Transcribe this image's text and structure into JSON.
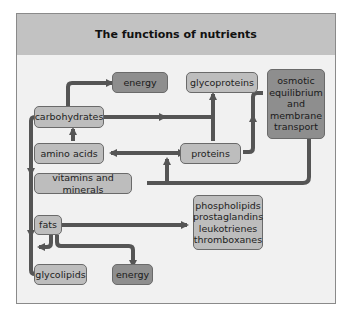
{
  "title": "The functions of nutrients",
  "colors": {
    "header_bg": "#c2c2c2",
    "panel_bg": "#f1f1f1",
    "light_box": "#bdbdbd",
    "dark_box": "#8e8e8e",
    "arrow": "#555555"
  },
  "nodes": {
    "energy_top": "energy",
    "glycoproteins": "glycoproteins",
    "osmotic": "osmotic equilibrium and membrane transport",
    "carbohydrates": "carbohydrates",
    "amino_acids": "amino acids",
    "proteins": "proteins",
    "vitamins": "vitamins and minerals",
    "fats": "fats",
    "lipids_products": "phospholipids prostaglandins leukotrienes thromboxanes",
    "glycolipids": "glycolipids",
    "energy_bottom": "energy"
  },
  "edges": [
    {
      "from": "carbohydrates",
      "to": "energy (top)"
    },
    {
      "from": "carbohydrates",
      "to": "glycoproteins"
    },
    {
      "from": "carbohydrates",
      "to": "glycolipids"
    },
    {
      "from": "amino acids",
      "to": "carbohydrates"
    },
    {
      "from": "amino acids",
      "to": "proteins",
      "bidirectional": true
    },
    {
      "from": "proteins",
      "to": "glycoproteins"
    },
    {
      "from": "proteins",
      "to": "osmotic equilibrium and membrane transport"
    },
    {
      "from": "vitamins and minerals",
      "to": "amino acids / proteins link"
    },
    {
      "from": "vitamins and minerals",
      "to": "osmotic equilibrium and membrane transport"
    },
    {
      "from": "fats",
      "to": "phospholipids prostaglandins leukotrienes thromboxanes"
    },
    {
      "from": "fats",
      "to": "glycolipids"
    },
    {
      "from": "fats",
      "to": "energy (bottom)"
    }
  ]
}
